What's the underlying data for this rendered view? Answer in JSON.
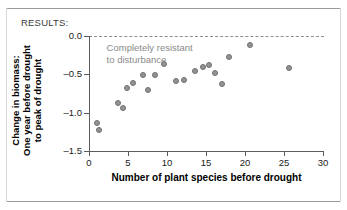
{
  "figure": {
    "section_label": "RESULTS:"
  },
  "chart_data": {
    "type": "scatter",
    "title": "",
    "xlabel": "Number of plant species before drought",
    "ylabel": "Change in biomass:\nOne year before drought\nto peak of drought",
    "ylabel_lines": [
      "Change in biomass:",
      "One year before drought",
      "to peak of drought"
    ],
    "xlim": [
      0,
      30
    ],
    "ylim": [
      -1.5,
      0.0
    ],
    "xticks": [
      0,
      5,
      10,
      15,
      20,
      25,
      30
    ],
    "xtick_labels": [
      "0",
      "5",
      "10",
      "15",
      "20",
      "25",
      "30"
    ],
    "yticks": [
      0.0,
      -0.5,
      -1.0,
      -1.5
    ],
    "ytick_labels": [
      "0.0",
      "-0.5",
      "-1.0",
      "-1.5"
    ],
    "grid": false,
    "legend": null,
    "reference_line": {
      "y": 0.0,
      "style": "dashed",
      "color": "#8e8e8e"
    },
    "annotations": [
      {
        "text_lines": [
          "Completely resistant",
          "to disturbance"
        ],
        "x": 2,
        "y": -0.07,
        "color": "#8a8a8a"
      }
    ],
    "marker": {
      "shape": "circle",
      "fill": "#939393",
      "edge": "#6f6f6f",
      "size": 6
    },
    "points": [
      {
        "x": 1.0,
        "y": -1.14
      },
      {
        "x": 1.3,
        "y": -1.22
      },
      {
        "x": 3.7,
        "y": -0.88
      },
      {
        "x": 4.3,
        "y": -0.94
      },
      {
        "x": 4.9,
        "y": -0.68
      },
      {
        "x": 5.6,
        "y": -0.61
      },
      {
        "x": 6.9,
        "y": -0.51
      },
      {
        "x": 7.6,
        "y": -0.7
      },
      {
        "x": 8.4,
        "y": -0.51
      },
      {
        "x": 9.6,
        "y": -0.36
      },
      {
        "x": 11.1,
        "y": -0.59
      },
      {
        "x": 12.2,
        "y": -0.57
      },
      {
        "x": 13.6,
        "y": -0.46
      },
      {
        "x": 14.6,
        "y": -0.4
      },
      {
        "x": 15.4,
        "y": -0.38
      },
      {
        "x": 16.2,
        "y": -0.48
      },
      {
        "x": 17.1,
        "y": -0.63
      },
      {
        "x": 18.0,
        "y": -0.28
      },
      {
        "x": 20.6,
        "y": -0.12
      },
      {
        "x": 25.6,
        "y": -0.42
      }
    ]
  }
}
